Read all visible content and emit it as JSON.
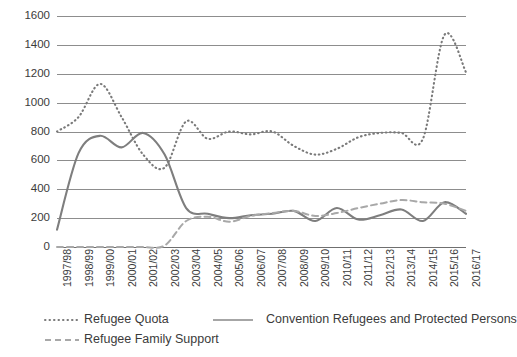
{
  "chart_data": {
    "type": "line",
    "title": "",
    "xlabel": "",
    "ylabel": "",
    "ylim": [
      0,
      1600
    ],
    "ytick_step": 200,
    "grid": true,
    "legend_position": "bottom-left",
    "categories": [
      "1997/98",
      "1998/99",
      "1999/00",
      "2000/01",
      "2001/02",
      "2002/03",
      "2003/04",
      "2004/05",
      "2005/06",
      "2006/07",
      "2007/08",
      "2008/09",
      "2009/10",
      "2010/11",
      "2011/12",
      "2012/13",
      "2013/14",
      "2014/15",
      "2015/16",
      "2016/17"
    ],
    "yticks": [
      0,
      200,
      400,
      600,
      800,
      1000,
      1200,
      1400,
      1600
    ],
    "series": [
      {
        "name": "Refugee Quota",
        "style": "dotted",
        "color": "#7a7a7a",
        "values": [
          800,
          900,
          1130,
          900,
          640,
          550,
          870,
          750,
          800,
          780,
          800,
          700,
          640,
          680,
          760,
          790,
          790,
          750,
          1470,
          1210
        ]
      },
      {
        "name": "Convention Refugees and Protected Persons",
        "style": "solid",
        "color": "#7e7e7e",
        "values": [
          120,
          650,
          770,
          690,
          790,
          640,
          270,
          230,
          200,
          220,
          230,
          250,
          180,
          270,
          190,
          220,
          260,
          180,
          310,
          230
        ]
      },
      {
        "name": "Refugee Family Support",
        "style": "dashed",
        "color": "#a8a8a8",
        "values": [
          0,
          0,
          0,
          0,
          0,
          10,
          180,
          210,
          175,
          215,
          235,
          250,
          215,
          235,
          270,
          300,
          325,
          310,
          300,
          250
        ]
      }
    ]
  },
  "axis": {
    "ytick_labels": [
      "1600",
      "1400",
      "1200",
      "1000",
      "800",
      "600",
      "400",
      "200",
      "0"
    ]
  },
  "legend": {
    "items": [
      {
        "label": "Refugee Quota",
        "style": "dotted"
      },
      {
        "label": "Convention Refugees and Protected Persons",
        "style": "solid"
      },
      {
        "label": "Refugee Family Support",
        "style": "dashed"
      }
    ]
  },
  "colors": {
    "grid": "#8d8d8d",
    "text": "#3b3b3b",
    "background": "#ffffff",
    "quota": "#7a7a7a",
    "convention": "#7e7e7e",
    "family": "#a8a8a8"
  }
}
